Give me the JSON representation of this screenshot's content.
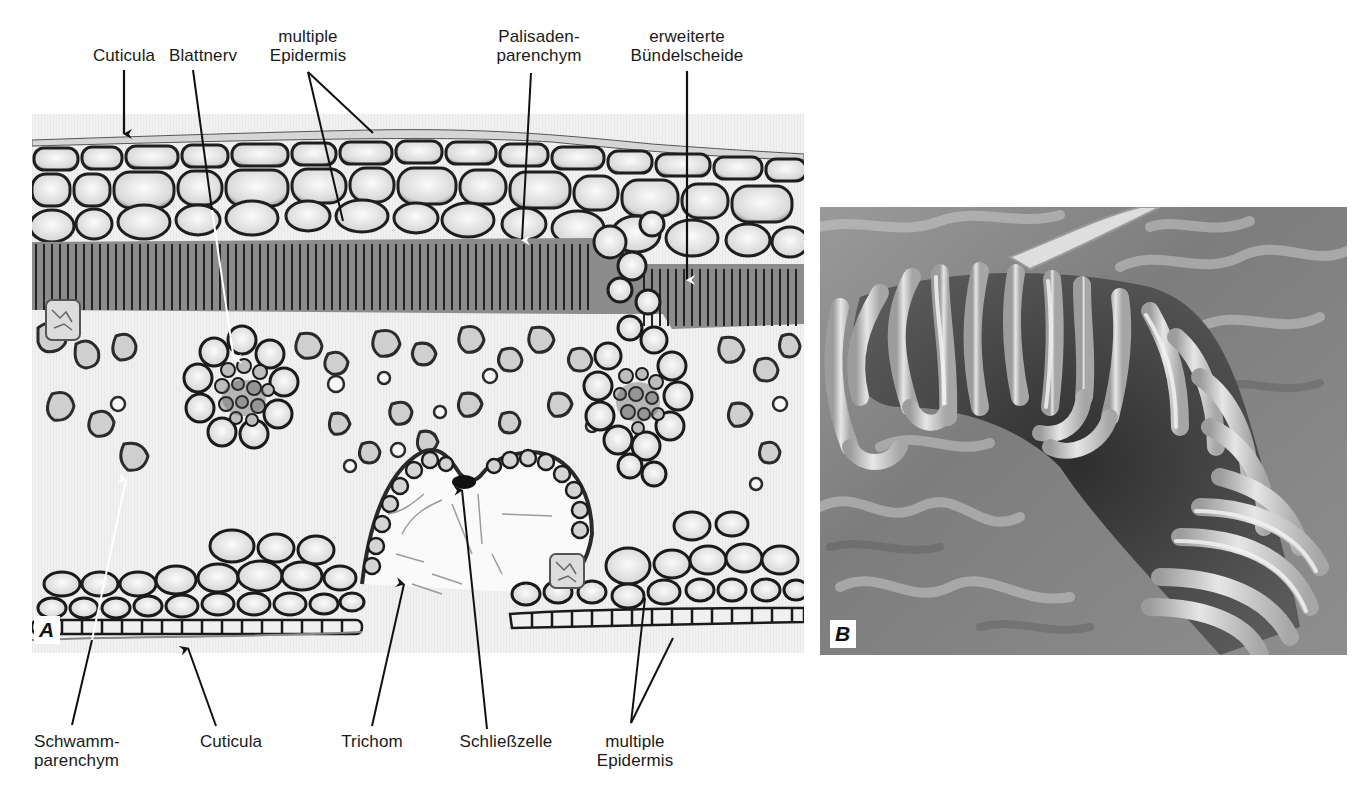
{
  "figure": {
    "panels": [
      {
        "id": "A",
        "letter": "A",
        "type": "light micrograph, leaf cross-section",
        "bbox": [
          32,
          114,
          804,
          653
        ]
      },
      {
        "id": "B",
        "letter": "B",
        "type": "scanning electron micrograph, trichomes",
        "bbox": [
          820,
          207,
          1347,
          655
        ]
      }
    ],
    "labels": {
      "top": {
        "cuticula": "Cuticula",
        "blattnerv": "Blattnerv",
        "multiple_epidermis": "multiple\nEpidermis",
        "palisadenparenchym": "Palisaden-\nparenchym",
        "erweiterte_buendelscheide": "erweiterte\nBündelscheide"
      },
      "bottom": {
        "schwammparenchym": "Schwamm-\nparenchym",
        "cuticula": "Cuticula",
        "trichom": "Trichom",
        "schliesszelle": "Schließzelle",
        "multiple_epidermis": "multiple\nEpidermis"
      }
    },
    "colors": {
      "background": "#ffffff",
      "text": "#1a1a1a",
      "leader_line": "#111111",
      "leader_line_inside": "#ffffff",
      "micrograph_light": "#f2f2f2",
      "micrograph_wall": "#1e1e1e",
      "sem_mid": "#8a8a8a",
      "sem_dark": "#3c3c3c",
      "sem_light": "#dcdcdc"
    }
  }
}
